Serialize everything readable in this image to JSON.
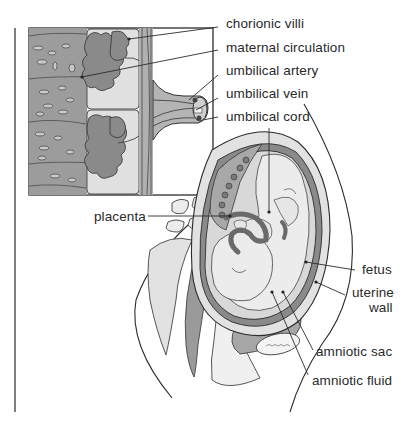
{
  "diagram": {
    "inset": {
      "description": "Enlarged cross-section of placenta and umbilical cord",
      "labels": [
        {
          "id": "chorionic-villi",
          "text": "chorionic villi"
        },
        {
          "id": "maternal-circulation",
          "text": "maternal circulation"
        },
        {
          "id": "umbilical-artery",
          "text": "umbilical artery"
        },
        {
          "id": "umbilical-vein",
          "text": "umbilical vein"
        },
        {
          "id": "umbilical-cord",
          "text": "umbilical cord"
        }
      ]
    },
    "main": {
      "labels": [
        {
          "id": "placenta",
          "text": "placenta"
        },
        {
          "id": "fetus",
          "text": "fetus"
        },
        {
          "id": "uterine-wall-1",
          "text": "uterine"
        },
        {
          "id": "uterine-wall-2",
          "text": "wall"
        },
        {
          "id": "amniotic-sac",
          "text": "amniotic sac"
        },
        {
          "id": "amniotic-fluid",
          "text": "amniotic fluid"
        }
      ]
    },
    "colors": {
      "line": "#2b2b2b",
      "tissue_dark": "#8a8a8a",
      "tissue_mid": "#b4b4b4",
      "tissue_light": "#d6d6d6",
      "tissue_pale": "#e8e8e8",
      "background": "#ffffff"
    }
  }
}
